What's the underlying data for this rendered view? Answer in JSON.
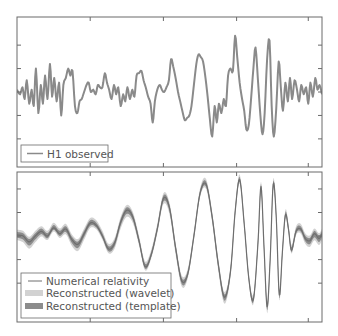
{
  "chart_data": [
    {
      "type": "line",
      "panel": "top",
      "title": "",
      "xlabel": "",
      "ylabel": "",
      "xlim": [
        0,
        1
      ],
      "ylim": [
        -3.2,
        3.2
      ],
      "x_ticks": [
        0.24,
        0.48,
        0.72,
        0.955
      ],
      "y_ticks": [
        -2,
        -1,
        0,
        1,
        2
      ],
      "tick_labels_visible": false,
      "grid": false,
      "legend_position": "lower left",
      "series": [
        {
          "name": "H1 observed",
          "color": "#8a8a8a",
          "style": "line",
          "x": [
            0.0,
            0.01,
            0.018,
            0.025,
            0.032,
            0.04,
            0.048,
            0.055,
            0.062,
            0.07,
            0.078,
            0.085,
            0.092,
            0.1,
            0.108,
            0.115,
            0.122,
            0.13,
            0.138,
            0.145,
            0.152,
            0.16,
            0.168,
            0.175,
            0.182,
            0.19,
            0.198,
            0.205,
            0.212,
            0.22,
            0.228,
            0.235,
            0.242,
            0.25,
            0.258,
            0.265,
            0.272,
            0.28,
            0.288,
            0.295,
            0.302,
            0.31,
            0.318,
            0.325,
            0.332,
            0.34,
            0.348,
            0.355,
            0.362,
            0.37,
            0.378,
            0.385,
            0.392,
            0.4,
            0.408,
            0.415,
            0.422,
            0.43,
            0.438,
            0.445,
            0.452,
            0.46,
            0.468,
            0.475,
            0.482,
            0.49,
            0.498,
            0.505,
            0.512,
            0.52,
            0.528,
            0.535,
            0.542,
            0.55,
            0.558,
            0.565,
            0.572,
            0.58,
            0.588,
            0.595,
            0.602,
            0.61,
            0.618,
            0.625,
            0.632,
            0.64,
            0.648,
            0.655,
            0.662,
            0.67,
            0.678,
            0.685,
            0.692,
            0.7,
            0.708,
            0.715,
            0.722,
            0.73,
            0.738,
            0.745,
            0.752,
            0.76,
            0.768,
            0.775,
            0.782,
            0.79,
            0.798,
            0.805,
            0.812,
            0.82,
            0.828,
            0.835,
            0.842,
            0.85,
            0.858,
            0.865,
            0.872,
            0.88,
            0.888,
            0.895,
            0.902,
            0.91,
            0.918,
            0.925,
            0.932,
            0.94,
            0.948,
            0.955,
            0.962,
            0.97,
            0.978,
            0.985,
            0.992,
            1.0
          ],
          "y": [
            0.1,
            -0.1,
            0.2,
            -0.3,
            0.5,
            -0.5,
            0.1,
            -0.6,
            1.0,
            -0.9,
            0.3,
            -0.5,
            0.7,
            -0.3,
            1.2,
            -0.2,
            0.6,
            -0.4,
            0.4,
            -1.0,
            0.3,
            0.6,
            1.0,
            0.7,
            0.9,
            -0.6,
            -0.9,
            -0.4,
            -0.3,
            0.0,
            0.3,
            0.4,
            0.0,
            0.1,
            -0.1,
            0.3,
            0.2,
            0.2,
            0.8,
            0.4,
            0.1,
            -0.3,
            0.3,
            -0.1,
            0.2,
            -0.6,
            -0.1,
            -0.4,
            0.2,
            -0.3,
            0.1,
            -0.2,
            0.7,
            0.8,
            0.9,
            0.5,
            0.2,
            -0.2,
            -0.5,
            -1.3,
            -0.4,
            0.1,
            0.3,
            0.1,
            0.0,
            0.2,
            0.5,
            1.4,
            1.1,
            0.6,
            0.0,
            -0.4,
            -0.8,
            -1.2,
            -1.1,
            -1.0,
            -0.6,
            0.3,
            1.2,
            1.6,
            1.5,
            1.3,
            0.6,
            -0.2,
            -1.1,
            -1.9,
            -0.6,
            -1.3,
            -0.5,
            -0.9,
            -0.3,
            -0.6,
            0.7,
            1.0,
            0.9,
            2.4,
            1.5,
            0.4,
            -0.3,
            -0.8,
            -1.6,
            -1.4,
            -0.2,
            1.0,
            1.9,
            0.5,
            -1.0,
            -1.8,
            -0.9,
            1.4,
            2.2,
            -0.6,
            -1.9,
            -0.7,
            1.3,
            0.2,
            -0.8,
            0.4,
            -0.4,
            0.6,
            -0.3,
            0.5,
            0.1,
            -0.4,
            0.3,
            -0.1,
            0.2,
            -0.5,
            0.4,
            -0.2,
            0.6,
            0.1,
            0.3,
            -0.1
          ]
        }
      ]
    },
    {
      "type": "line",
      "panel": "bottom",
      "title": "",
      "xlabel": "",
      "ylabel": "",
      "xlim": [
        0,
        1
      ],
      "ylim": [
        -3.65,
        2.72
      ],
      "x_ticks": [
        0.24,
        0.48,
        0.72,
        0.955
      ],
      "y_ticks": [
        -2,
        -1,
        0,
        1,
        2
      ],
      "tick_labels_visible": false,
      "grid": false,
      "legend_position": "lower left",
      "series": [
        {
          "name": "Reconstructed (wavelet)",
          "color": "#d2d2d2",
          "style": "band",
          "band_halfwidth": 0.22
        },
        {
          "name": "Reconstructed (template)",
          "color": "#8c8c8c",
          "style": "band",
          "band_halfwidth": 0.12
        },
        {
          "name": "Numerical relativity",
          "color": "#6e6e6e",
          "style": "line",
          "x": [
            0.0,
            0.02,
            0.04,
            0.06,
            0.08,
            0.1,
            0.12,
            0.14,
            0.16,
            0.18,
            0.2,
            0.22,
            0.24,
            0.26,
            0.28,
            0.3,
            0.32,
            0.34,
            0.36,
            0.38,
            0.4,
            0.42,
            0.44,
            0.46,
            0.48,
            0.5,
            0.52,
            0.54,
            0.56,
            0.58,
            0.6,
            0.62,
            0.64,
            0.66,
            0.68,
            0.7,
            0.715,
            0.73,
            0.745,
            0.76,
            0.775,
            0.79,
            0.8,
            0.81,
            0.82,
            0.83,
            0.84,
            0.85,
            0.86,
            0.87,
            0.88,
            0.89,
            0.9,
            0.915,
            0.93,
            0.945,
            0.96,
            0.975,
            0.99,
            1.0
          ],
          "y": [
            0.05,
            0.0,
            -0.25,
            0.0,
            0.2,
            0.0,
            0.35,
            0.1,
            0.3,
            -0.15,
            -0.35,
            0.1,
            0.55,
            0.45,
            0.0,
            -0.55,
            -0.3,
            0.6,
            1.1,
            0.8,
            -0.2,
            -1.3,
            -0.8,
            0.3,
            1.6,
            1.2,
            -0.5,
            -1.9,
            -1.6,
            0.0,
            1.8,
            2.2,
            0.8,
            -1.2,
            -2.6,
            -1.5,
            1.0,
            2.4,
            0.5,
            -1.8,
            -2.7,
            -0.3,
            2.1,
            -0.5,
            -3.0,
            -1.0,
            2.2,
            0.8,
            -2.5,
            -0.7,
            0.9,
            0.3,
            -0.6,
            0.2,
            0.3,
            -0.1,
            -0.2,
            0.1,
            -0.1,
            0.1
          ]
        }
      ]
    }
  ],
  "top_panel": {
    "legend": {
      "items": [
        {
          "label": "H1 observed"
        }
      ]
    }
  },
  "bottom_panel": {
    "legend": {
      "items": [
        {
          "label": "Numerical relativity"
        },
        {
          "label": "Reconstructed (wavelet)"
        },
        {
          "label": "Reconstructed (template)"
        }
      ]
    }
  },
  "colors": {
    "axes": "#6a6a6a",
    "observed": "#8a8a8a",
    "nr_line": "#6e6e6e",
    "wavelet_band": "#d2d2d2",
    "template_band": "#8c8c8c",
    "legend_text": "#555555"
  }
}
